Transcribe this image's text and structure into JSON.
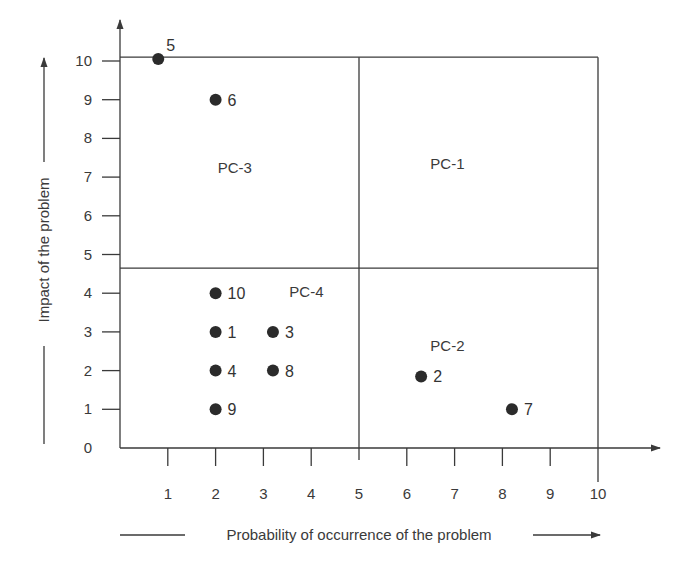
{
  "chart_data": {
    "type": "scatter",
    "title": "",
    "xlabel": "Probability of occurrence of the problem",
    "ylabel": "Impact of the problem",
    "xlim": [
      0,
      10
    ],
    "ylim": [
      0,
      10
    ],
    "xticks": [
      "1",
      "2",
      "3",
      "4",
      "5",
      "6",
      "7",
      "8",
      "9",
      "10"
    ],
    "yticks": [
      "0",
      "1",
      "2",
      "3",
      "4",
      "5",
      "6",
      "7",
      "8",
      "9",
      "10"
    ],
    "grid": false,
    "quadrant_divider": {
      "x": 5,
      "y": 4.65,
      "x_max": 10,
      "y_max": 10.1
    },
    "quadrants": [
      {
        "label": "PC-1",
        "x": 6.85,
        "y": 7.2
      },
      {
        "label": "PC-2",
        "x": 6.85,
        "y": 2.5
      },
      {
        "label": "PC-3",
        "x": 2.4,
        "y": 7.1
      },
      {
        "label": "PC-4",
        "x": 3.9,
        "y": 3.9
      }
    ],
    "points": [
      {
        "label": "1",
        "x": 2.0,
        "y": 3.0
      },
      {
        "label": "2",
        "x": 6.3,
        "y": 1.85
      },
      {
        "label": "3",
        "x": 3.2,
        "y": 3.0
      },
      {
        "label": "4",
        "x": 2.0,
        "y": 2.0
      },
      {
        "label": "5",
        "x": 0.8,
        "y": 10.05
      },
      {
        "label": "6",
        "x": 2.0,
        "y": 9.0
      },
      {
        "label": "7",
        "x": 8.2,
        "y": 1.0
      },
      {
        "label": "8",
        "x": 3.2,
        "y": 2.0
      },
      {
        "label": "9",
        "x": 2.0,
        "y": 1.0
      },
      {
        "label": "10",
        "x": 2.0,
        "y": 4.0
      }
    ]
  }
}
